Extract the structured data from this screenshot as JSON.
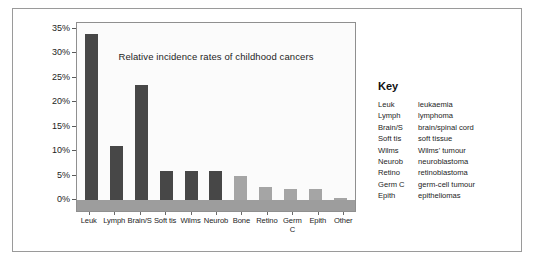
{
  "figure": {
    "key_heading": "Key"
  },
  "chart_data": {
    "type": "bar",
    "title": "Relative incidence rates of childhood cancers",
    "xlabel": "",
    "ylabel": "",
    "ylim": [
      0,
      35
    ],
    "grid": false,
    "legend_position": "right",
    "categories": [
      "Leuk",
      "Lymph",
      "Brain/S",
      "Soft tis",
      "Wilms",
      "Neurob",
      "Bone",
      "Retino",
      "Germ C",
      "Epith",
      "Other"
    ],
    "values": [
      34,
      11,
      23.5,
      6,
      6,
      6,
      5,
      2.7,
      2.3,
      2.2,
      0.5
    ],
    "bar_shades": [
      "dark",
      "dark",
      "dark",
      "dark",
      "dark",
      "dark",
      "light",
      "light",
      "light",
      "light",
      "light"
    ],
    "ytick_labels": [
      "35%",
      "30%",
      "25%",
      "20%",
      "15%",
      "10%",
      "5%",
      "0%"
    ],
    "ytick_values": [
      35,
      30,
      25,
      20,
      15,
      10,
      5,
      0
    ],
    "colors": {
      "bar_dark": "#474747",
      "bar_light": "#a5a5a5",
      "floor_band": "#9d9d9d",
      "plot_background": "#fbfbfb",
      "axis_line": "#8f8f8f"
    }
  },
  "key": {
    "heading": "Key",
    "entries": [
      {
        "abbr": "Leuk",
        "full": "leukaemia"
      },
      {
        "abbr": "Lymph",
        "full": "lymphoma"
      },
      {
        "abbr": "Brain/S",
        "full": "brain/spinal cord"
      },
      {
        "abbr": "Soft tis",
        "full": "soft tissue"
      },
      {
        "abbr": "Wilms",
        "full": "Wilms' tumour"
      },
      {
        "abbr": "Neurob",
        "full": "neuroblastoma"
      },
      {
        "abbr": "Retino",
        "full": "retinoblastoma"
      },
      {
        "abbr": "Germ C",
        "full": "germ-cell tumour"
      },
      {
        "abbr": "Epith",
        "full": "epitheliomas"
      }
    ]
  }
}
